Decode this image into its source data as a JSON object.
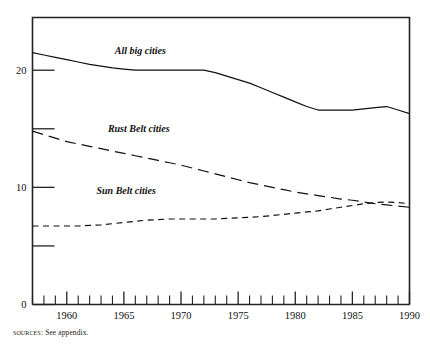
{
  "figure": {
    "source_note_label": "Sources:",
    "source_note_text": " See appendix."
  },
  "chart_data": {
    "type": "line",
    "title": "",
    "subtitle": "",
    "xlabel": "",
    "ylabel": "",
    "xlim": [
      1957,
      1990
    ],
    "ylim": [
      0,
      24.5
    ],
    "grid": false,
    "legend_position": "inline-labels",
    "x_tick_labels": [
      "1960",
      "1965",
      "1970",
      "1975",
      "1980",
      "1985",
      "1990"
    ],
    "x_tick_values": [
      1960,
      1965,
      1970,
      1975,
      1980,
      1985,
      1990
    ],
    "x_minor_tick_values": [
      1957,
      1958,
      1959,
      1960,
      1961,
      1962,
      1963,
      1964,
      1965,
      1966,
      1967,
      1968,
      1969,
      1970,
      1971,
      1972,
      1973,
      1974,
      1975,
      1976,
      1977,
      1978,
      1979,
      1980,
      1981,
      1982,
      1983,
      1984,
      1985,
      1986,
      1987,
      1988,
      1989,
      1990
    ],
    "y_tick_values": [
      0,
      5,
      10,
      15,
      20
    ],
    "y_tick_labels": [
      "0",
      "",
      "10",
      "",
      "20"
    ],
    "y_labeled_ticks": [
      {
        "value": 0,
        "label": "0"
      },
      {
        "value": 10,
        "label": "10"
      },
      {
        "value": 20,
        "label": "20"
      }
    ],
    "x": [
      1957,
      1958,
      1959,
      1960,
      1961,
      1962,
      1963,
      1964,
      1965,
      1966,
      1967,
      1968,
      1969,
      1970,
      1971,
      1972,
      1973,
      1974,
      1975,
      1976,
      1977,
      1978,
      1979,
      1980,
      1981,
      1982,
      1983,
      1984,
      1985,
      1986,
      1987,
      1988,
      1989,
      1990
    ],
    "series": [
      {
        "name": "All big cities",
        "label": "All big cities",
        "style": "solid",
        "label_x": 1964.2,
        "label_y": 21.4,
        "values": [
          21.5,
          21.3,
          21.1,
          20.9,
          20.7,
          20.5,
          20.35,
          20.2,
          20.1,
          20.0,
          20.0,
          20.0,
          20.0,
          20.0,
          20.0,
          20.0,
          19.8,
          19.5,
          19.2,
          18.9,
          18.5,
          18.1,
          17.7,
          17.3,
          16.9,
          16.6,
          16.6,
          16.6,
          16.6,
          16.7,
          16.8,
          16.9,
          16.6,
          16.3
        ]
      },
      {
        "name": "Rust Belt cities",
        "label": "Rust Belt cities",
        "style": "long-dash",
        "label_x": 1963.6,
        "label_y": 14.7,
        "values": [
          14.8,
          14.5,
          14.2,
          13.9,
          13.7,
          13.5,
          13.3,
          13.1,
          12.9,
          12.7,
          12.5,
          12.3,
          12.1,
          11.9,
          11.65,
          11.4,
          11.15,
          10.9,
          10.65,
          10.4,
          10.2,
          10.0,
          9.8,
          9.6,
          9.45,
          9.3,
          9.15,
          9.0,
          8.9,
          8.75,
          8.6,
          8.5,
          8.4,
          8.3
        ]
      },
      {
        "name": "Sun Belt cities",
        "label": "Sun Belt cities",
        "style": "short-dash",
        "label_x": 1962.6,
        "label_y": 9.4,
        "values": [
          6.7,
          6.7,
          6.7,
          6.7,
          6.7,
          6.75,
          6.8,
          6.9,
          7.0,
          7.1,
          7.2,
          7.25,
          7.3,
          7.3,
          7.3,
          7.3,
          7.3,
          7.35,
          7.4,
          7.45,
          7.5,
          7.6,
          7.7,
          7.8,
          7.9,
          8.0,
          8.15,
          8.3,
          8.45,
          8.6,
          8.7,
          8.75,
          8.7,
          8.6
        ]
      }
    ]
  }
}
